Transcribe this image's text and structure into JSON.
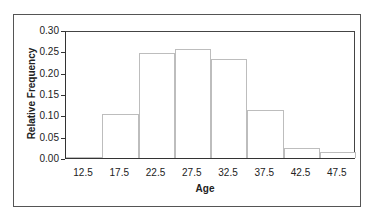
{
  "chart_data": {
    "type": "bar",
    "title": "",
    "xlabel": "Age",
    "ylabel": "Relative Frequency",
    "categories": [
      "12.5",
      "17.5",
      "22.5",
      "27.5",
      "32.5",
      "37.5",
      "42.5",
      "47.5"
    ],
    "values": [
      0.0,
      0.105,
      0.25,
      0.26,
      0.235,
      0.115,
      0.025,
      0.015
    ],
    "ylim": [
      0,
      0.3
    ],
    "yticks": [
      "0.30",
      "0.25",
      "0.20",
      "0.15",
      "0.10",
      "0.05",
      "0.00"
    ],
    "grid": false,
    "legend": null,
    "bar_fill": "#ffffff",
    "bar_edge": "#bdbdbd"
  }
}
